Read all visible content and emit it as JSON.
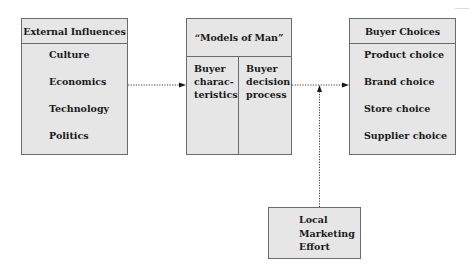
{
  "diagram": {
    "external": {
      "title": "External Influences",
      "items": [
        "Culture",
        "Economics",
        "Technology",
        "Politics"
      ]
    },
    "models": {
      "title": "“Models of Man”",
      "left": [
        "Buyer",
        "charac-",
        "teristics"
      ],
      "right": [
        "Buyer",
        "decision",
        "process"
      ]
    },
    "choices": {
      "title": "Buyer Choices",
      "items": [
        "Product choice",
        "Brand choice",
        "Store choice",
        "Supplier choice"
      ]
    },
    "marketing": {
      "lines": [
        "Local",
        "Marketing",
        "Effort"
      ]
    },
    "edges": [
      {
        "from": "External Influences",
        "to": "Models of Man",
        "style": "dotted-arrow"
      },
      {
        "from": "Models of Man",
        "to": "Buyer Choices",
        "style": "dotted-arrow"
      },
      {
        "from": "Local Marketing Effort",
        "to": "Models of Man → Buyer Choices link",
        "style": "dotted-arrow"
      }
    ],
    "colors": {
      "box_fill": "#e6e6e6",
      "border": "#6b6b6b",
      "text": "#1a1a1a"
    }
  }
}
